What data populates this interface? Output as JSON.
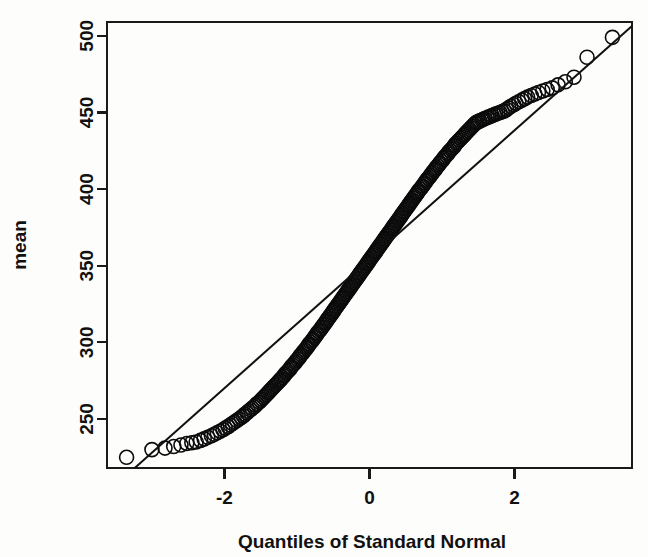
{
  "figure": {
    "background_color": "#fdfdfc",
    "ink_color": "#111111"
  },
  "axes": {
    "x_title": "Quantiles of Standard Normal",
    "y_title": "mean",
    "x_ticks": [
      "-2",
      "0",
      "2"
    ],
    "y_ticks": [
      "250",
      "300",
      "350",
      "400",
      "450",
      "500"
    ]
  },
  "chart_data": {
    "type": "scatter",
    "title": "",
    "subtitle": "",
    "xlabel": "Quantiles of Standard Normal",
    "ylabel": "mean",
    "xlim": [
      -3.62,
      3.62
    ],
    "ylim": [
      218,
      509
    ],
    "xticks": [
      -2,
      0,
      2
    ],
    "yticks": [
      250,
      300,
      350,
      400,
      450,
      500
    ],
    "grid": false,
    "legend": null,
    "marker": "open-circle",
    "marker_size_px": 14,
    "reference_line": {
      "description": "qqline through first and third quartiles",
      "x1": -3.0,
      "y1": 228.0,
      "x2": 3.3,
      "y2": 493.0,
      "slope": 42.06,
      "intercept": 354.2
    },
    "n_points": 220,
    "note": "Normal Q-Q plot of sample means; both tails bend above the reference line (heavy right tail, short left tail).",
    "x": [
      -3.35,
      -3.0,
      -2.82,
      -2.7,
      -2.6,
      -2.52,
      -2.45,
      -2.39,
      -2.33,
      -2.28,
      -2.23,
      -2.18,
      -2.14,
      -2.1,
      -2.06,
      -2.02,
      -1.99,
      -1.95,
      -1.92,
      -1.89,
      -1.86,
      -1.83,
      -1.8,
      -1.77,
      -1.74,
      -1.72,
      -1.69,
      -1.67,
      -1.64,
      -1.62,
      -1.59,
      -1.57,
      -1.55,
      -1.52,
      -1.5,
      -1.48,
      -1.46,
      -1.44,
      -1.42,
      -1.4,
      -1.38,
      -1.36,
      -1.34,
      -1.32,
      -1.3,
      -1.28,
      -1.26,
      -1.24,
      -1.22,
      -1.2,
      -1.18,
      -1.17,
      -1.15,
      -1.13,
      -1.11,
      -1.09,
      -1.08,
      -1.06,
      -1.04,
      -1.02,
      -1.01,
      -0.99,
      -0.97,
      -0.96,
      -0.94,
      -0.92,
      -0.91,
      -0.89,
      -0.87,
      -0.86,
      -0.84,
      -0.83,
      -0.81,
      -0.79,
      -0.78,
      -0.76,
      -0.75,
      -0.73,
      -0.72,
      -0.7,
      -0.68,
      -0.67,
      -0.65,
      -0.64,
      -0.62,
      -0.61,
      -0.59,
      -0.58,
      -0.56,
      -0.55,
      -0.53,
      -0.52,
      -0.5,
      -0.49,
      -0.47,
      -0.46,
      -0.44,
      -0.43,
      -0.41,
      -0.4,
      -0.38,
      -0.37,
      -0.35,
      -0.34,
      -0.32,
      -0.31,
      -0.29,
      -0.28,
      -0.26,
      -0.25,
      -0.23,
      -0.22,
      -0.2,
      -0.19,
      -0.17,
      -0.16,
      -0.14,
      -0.13,
      -0.11,
      -0.1,
      -0.08,
      -0.07,
      -0.05,
      -0.04,
      -0.02,
      -0.01,
      0.01,
      0.02,
      0.04,
      0.05,
      0.07,
      0.08,
      0.1,
      0.11,
      0.13,
      0.14,
      0.16,
      0.17,
      0.19,
      0.2,
      0.22,
      0.23,
      0.25,
      0.26,
      0.28,
      0.29,
      0.31,
      0.32,
      0.34,
      0.35,
      0.37,
      0.38,
      0.4,
      0.41,
      0.43,
      0.44,
      0.46,
      0.47,
      0.49,
      0.5,
      0.52,
      0.53,
      0.55,
      0.56,
      0.58,
      0.59,
      0.61,
      0.62,
      0.64,
      0.65,
      0.67,
      0.68,
      0.7,
      0.72,
      0.73,
      0.75,
      0.76,
      0.78,
      0.79,
      0.81,
      0.83,
      0.84,
      0.86,
      0.87,
      0.89,
      0.91,
      0.92,
      0.94,
      0.96,
      0.97,
      0.99,
      1.01,
      1.02,
      1.04,
      1.06,
      1.08,
      1.09,
      1.11,
      1.13,
      1.15,
      1.17,
      1.18,
      1.2,
      1.22,
      1.24,
      1.26,
      1.28,
      1.3,
      1.32,
      1.34,
      1.36,
      1.38,
      1.4,
      1.42,
      1.44,
      1.46,
      1.48,
      1.5,
      1.52,
      1.55,
      1.57,
      1.59,
      1.62,
      1.64,
      1.67,
      1.69,
      1.72,
      1.74,
      1.77,
      1.8,
      1.83,
      1.86,
      1.89,
      1.92,
      1.95,
      1.99,
      2.02,
      2.06,
      2.1,
      2.14,
      2.18,
      2.23,
      2.28,
      2.33,
      2.39,
      2.45,
      2.52,
      2.6,
      2.7,
      2.82,
      3.0,
      3.35
    ],
    "y": [
      225,
      230,
      231,
      232,
      233,
      234,
      234.5,
      235,
      236,
      237,
      238,
      239,
      240,
      241,
      242,
      243,
      244,
      245,
      246,
      247,
      248,
      249,
      250,
      251,
      252,
      253,
      254,
      255,
      256,
      257,
      258,
      259,
      260,
      261,
      262,
      263,
      264,
      265,
      266,
      267,
      268,
      269,
      270,
      271,
      272,
      273,
      274,
      275,
      276,
      277,
      278,
      279,
      280,
      281,
      282,
      283,
      284,
      285,
      286,
      287,
      288,
      289,
      290,
      291,
      292,
      293,
      294,
      295,
      296,
      297,
      298,
      299,
      300,
      301,
      302,
      303,
      304,
      305,
      306,
      307,
      308,
      309,
      310,
      311,
      312,
      313,
      314,
      315,
      316,
      317,
      318,
      319,
      320,
      321,
      322,
      323,
      324,
      325,
      326,
      327,
      328,
      329,
      330,
      331,
      332,
      333,
      334,
      335,
      336,
      337,
      338,
      339,
      340,
      341,
      342,
      343,
      344,
      345,
      346,
      347,
      348,
      349,
      350,
      351,
      352,
      353,
      354,
      355,
      356,
      357,
      358,
      359,
      360,
      361,
      362,
      363,
      364,
      365,
      366,
      367,
      368,
      369,
      370,
      371,
      372,
      373,
      374,
      375,
      376,
      377,
      378,
      379,
      380,
      381,
      382,
      383,
      384,
      385,
      386,
      387,
      388,
      389,
      390,
      391,
      392,
      393,
      394,
      395,
      396,
      397,
      398,
      399,
      400,
      401,
      402,
      403,
      404,
      405,
      406,
      407,
      408,
      409,
      410,
      411,
      412,
      413,
      414,
      415,
      416,
      417,
      418,
      419,
      420,
      421,
      422,
      423,
      424,
      425,
      426,
      427,
      428,
      429,
      430,
      431,
      432,
      433,
      434,
      435,
      436,
      437,
      438,
      439,
      440,
      441,
      442,
      443,
      443.5,
      444,
      444.5,
      445,
      445.5,
      446,
      446.5,
      447,
      447.5,
      448,
      448.5,
      449,
      449.5,
      450,
      450.5,
      451,
      452,
      453,
      454,
      455,
      456,
      457,
      458,
      459,
      460,
      461,
      462,
      463,
      464,
      465,
      466,
      468,
      470,
      473,
      486,
      499
    ]
  }
}
